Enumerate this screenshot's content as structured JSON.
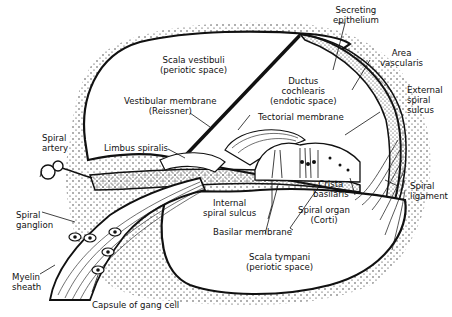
{
  "diagram": {
    "labels": {
      "secreting_epithelium": [
        "Secreting",
        "epithelium"
      ],
      "area_vascularis": [
        "Area",
        "vascularis"
      ],
      "scala_vestibuli": [
        "Scala vestibuli",
        "(periotic space)"
      ],
      "ductus_cochlearis": [
        "Ductus",
        "cochlearis",
        "(endotic space)"
      ],
      "vestibular_membrane": [
        "Vestibular membrane",
        "(Reissner)"
      ],
      "external_spiral_sulcus": [
        "External",
        "spiral",
        "sulcus"
      ],
      "tectorial_membrane": [
        "Tectorial membrane"
      ],
      "spiral_artery": [
        "Spiral",
        "artery"
      ],
      "limbus_spiralis": [
        "Limbus spiralis"
      ],
      "crista_basilaris": [
        "Crista",
        "basilaris"
      ],
      "spiral_ligament": [
        "Spiral",
        "ligament"
      ],
      "internal_spiral_sulcus": [
        "Internal",
        "spiral sulcus"
      ],
      "spiral_organ": [
        "Spiral organ",
        "(Corti)"
      ],
      "spiral_ganglion": [
        "Spiral",
        "ganglion"
      ],
      "basilar_membrane": [
        "Basilar membrane"
      ],
      "scala_tympani": [
        "Scala tympani",
        "(periotic space)"
      ],
      "myelin_sheath": [
        "Myelin",
        "sheath"
      ],
      "capsule_gang_cell": [
        "Capsule of gang cell"
      ]
    },
    "colors": {
      "ink": "#111111",
      "background": "#ffffff"
    }
  }
}
